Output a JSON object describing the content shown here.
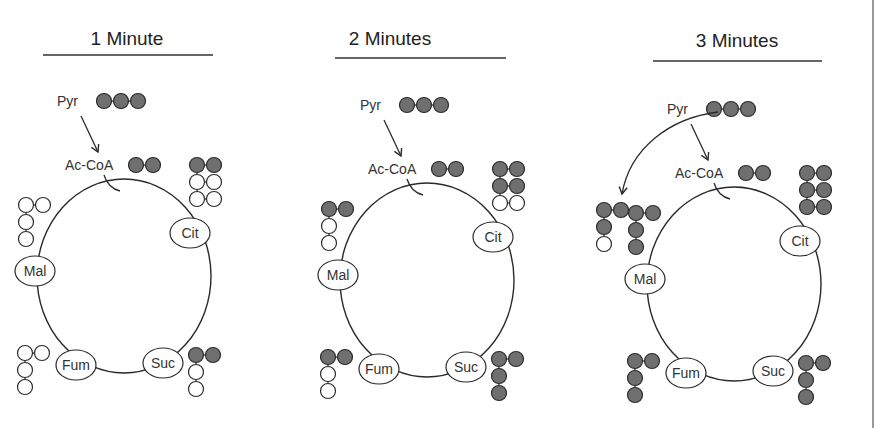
{
  "colors": {
    "filled": "#6f6f6f",
    "empty": "#ffffff",
    "stroke": "#2a2a2a",
    "text": "#333333",
    "edge": "#9a9a9a"
  },
  "labels": {
    "pyruvate": "Pyr",
    "acetyl_coa": "Ac-CoA",
    "citrate": "Cit",
    "malate": "Mal",
    "fumarate": "Fum",
    "succinate": "Suc"
  },
  "panels": [
    {
      "title": "1 Minute",
      "pyr_carbons": [
        "filled",
        "filled",
        "filled"
      ],
      "accoa_carbons": [
        "filled",
        "filled"
      ],
      "pyr_to_oaa_arrow": false,
      "citrate": [
        [
          "filled",
          "filled"
        ],
        [
          "empty",
          "empty"
        ],
        [
          "empty",
          "empty"
        ]
      ],
      "malate": {
        "top": [
          "empty",
          "empty"
        ],
        "chain": [
          "empty",
          "empty"
        ]
      },
      "fumarate": {
        "top": [
          "empty",
          "empty"
        ],
        "chain": [
          "empty",
          "empty"
        ]
      },
      "succinate": {
        "top": [
          "filled",
          "filled"
        ],
        "chain": [
          "empty",
          "empty"
        ]
      },
      "extra_structures": []
    },
    {
      "title": "2 Minutes",
      "pyr_carbons": [
        "filled",
        "filled",
        "filled"
      ],
      "accoa_carbons": [
        "filled",
        "filled"
      ],
      "pyr_to_oaa_arrow": false,
      "citrate": [
        [
          "filled",
          "filled"
        ],
        [
          "filled",
          "filled"
        ],
        [
          "empty",
          "empty"
        ]
      ],
      "malate": {
        "top": [
          "filled",
          "filled"
        ],
        "chain": [
          "empty",
          "empty"
        ]
      },
      "fumarate": {
        "top": [
          "filled",
          "filled"
        ],
        "chain": [
          "empty",
          "empty"
        ]
      },
      "succinate": {
        "top": [
          "filled",
          "filled"
        ],
        "chain": [
          "filled",
          "filled"
        ]
      },
      "extra_structures": []
    },
    {
      "title": "3 Minutes",
      "pyr_carbons": [
        "filled",
        "filled",
        "filled"
      ],
      "accoa_carbons": [
        "filled",
        "filled"
      ],
      "pyr_to_oaa_arrow": true,
      "citrate": [
        [
          "filled",
          "filled"
        ],
        [
          "filled",
          "filled"
        ],
        [
          "filled",
          "filled"
        ]
      ],
      "malate": {
        "top": [
          "filled",
          "filled"
        ],
        "chain": [
          "filled",
          "filled"
        ]
      },
      "fumarate": {
        "top": [
          "filled",
          "filled"
        ],
        "chain": [
          "filled",
          "filled"
        ]
      },
      "succinate": {
        "top": [
          "filled",
          "filled"
        ],
        "chain": [
          "filled",
          "filled"
        ]
      },
      "extra_structures": [
        {
          "name": "oxaloacetate-from-pyruvate",
          "top": [
            "filled",
            "filled"
          ],
          "chain": [
            "filled",
            "empty"
          ]
        }
      ]
    }
  ]
}
